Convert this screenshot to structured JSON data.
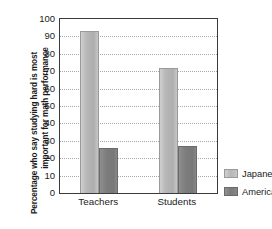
{
  "chart_data": {
    "type": "bar",
    "title": "",
    "xlabel": "",
    "ylabel_line1": "Percentage who say studying hard is most",
    "ylabel_line2": "important for math performance",
    "categories": [
      "Teachers",
      "Students"
    ],
    "series": [
      {
        "name": "Japanese",
        "values": [
          93,
          72
        ],
        "color": "#b6b6b6"
      },
      {
        "name": "Americans",
        "values": [
          26,
          27
        ],
        "color": "#7c7c7c"
      }
    ],
    "ylim": [
      0,
      100
    ],
    "yticks": [
      0,
      10,
      20,
      30,
      40,
      50,
      60,
      70,
      80,
      90,
      100
    ],
    "ytick_labels": [
      "0",
      "10",
      "20",
      "30",
      "40",
      "50",
      "60",
      "70",
      "80",
      "90",
      "100"
    ],
    "grid": true,
    "grid_style": "dotted",
    "legend_position": "right"
  },
  "legend": {
    "items": [
      {
        "label": "Japanese"
      },
      {
        "label": "Americans"
      }
    ]
  }
}
